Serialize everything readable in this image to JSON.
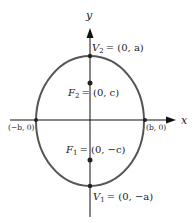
{
  "diagram": {
    "type": "ellipse-with-foci",
    "axes": {
      "x_label": "x",
      "y_label": "y"
    },
    "points": {
      "v2": {
        "name": "V",
        "sub": "2",
        "coords": "= (0, a)"
      },
      "f2": {
        "name": "F",
        "sub": "2",
        "coords": "= (0, c)"
      },
      "f1": {
        "name": "F",
        "sub": "1",
        "coords": "= (0, −c)"
      },
      "v1": {
        "name": "V",
        "sub": "1",
        "coords": "= (0, −a)"
      },
      "left": {
        "label": "(−b, 0)"
      },
      "right": {
        "label": "(b, 0)"
      }
    },
    "colors": {
      "ellipse": "#555555",
      "axes": "#111111",
      "text": "#222222"
    }
  }
}
